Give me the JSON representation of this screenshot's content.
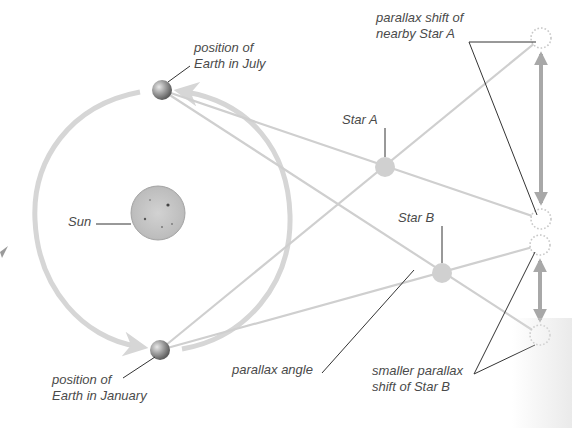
{
  "diagram": {
    "labels": {
      "earth_july": [
        "position of",
        "Earth in July"
      ],
      "earth_january": [
        "position of",
        "Earth in January"
      ],
      "sun": "Sun",
      "star_a": "Star A",
      "star_b": "Star B",
      "parallax_shift_a": [
        "parallax shift of",
        "nearby Star A"
      ],
      "parallax_shift_b": [
        "smaller parallax",
        "shift of Star B"
      ],
      "parallax_angle": "parallax angle"
    },
    "colors": {
      "orbit": "#d6d6d6",
      "sight_lines": "#cfcfcf",
      "star_fill": "#d0d0d0",
      "sun_fill": "#c4c4c4",
      "earth_fill": "#9a9a9a",
      "shift_arrow": "#a8a8a8",
      "leader_lines": "#333333",
      "text": "#4a4a4a"
    },
    "nodes": {
      "sun": {
        "x": 158,
        "y": 213,
        "r": 27
      },
      "earth_july": {
        "x": 162,
        "y": 90,
        "r": 10
      },
      "earth_january": {
        "x": 160,
        "y": 350,
        "r": 10
      },
      "star_a": {
        "x": 385,
        "y": 167,
        "r": 10
      },
      "star_b": {
        "x": 442,
        "y": 273,
        "r": 10
      },
      "apparent_a_top": {
        "x": 541,
        "y": 38,
        "r": 11
      },
      "apparent_a_bottom": {
        "x": 541,
        "y": 219,
        "r": 11
      },
      "apparent_b_top": {
        "x": 540,
        "y": 245,
        "r": 11
      },
      "apparent_b_bottom": {
        "x": 540,
        "y": 335,
        "r": 11
      }
    }
  }
}
